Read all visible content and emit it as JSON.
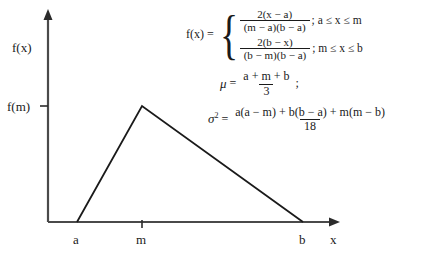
{
  "figure": {
    "type": "triangular-distribution-pdf",
    "axes": {
      "y_axis_label": "f(x)",
      "y_tick_label": "f(m)",
      "x_axis_label": "x",
      "x_tick_labels": [
        "a",
        "m",
        "b"
      ]
    },
    "curve": {
      "name": "triangular-pdf-outline",
      "vertices": [
        {
          "label": "a",
          "x": 77,
          "y": 222
        },
        {
          "label": "m",
          "x": 142,
          "y": 106
        },
        {
          "label": "b",
          "x": 303,
          "y": 222
        }
      ]
    },
    "line_color": "#1a1a1a",
    "background_color": "#ffffff"
  },
  "formulas": {
    "pdf": {
      "lhs": "f(x) =",
      "brace": "{",
      "cases": [
        {
          "numerator": "2(x − a)",
          "denominator": "(m − a)(b − a)",
          "condition": "; a ≤ x ≤ m"
        },
        {
          "numerator": "2(b − x)",
          "denominator": "(b − m)(b − a)",
          "condition": "; m ≤ x ≤ b"
        }
      ]
    },
    "mean": {
      "symbol": "μ",
      "equals": "=",
      "numerator": "a + m + b",
      "denominator": "3",
      "trailing": ";"
    },
    "variance": {
      "symbol": "σ",
      "exponent": "2",
      "equals": "=",
      "numerator": "a(a − m) + b(b − a) + m(m − b)",
      "denominator": "18"
    }
  }
}
